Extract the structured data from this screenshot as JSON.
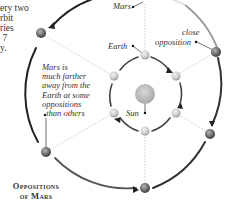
{
  "intro_text": "ery two\nrbit\nries\n 7\ny.",
  "labels": {
    "mars": "Mars",
    "earth": "Earth",
    "close_opposition_1": "close",
    "close_opposition_2": "opposition",
    "sun": "Sun"
  },
  "note": "Mars is\nmuch farther\naway from the\nEarth at some\noppositions\n  than others",
  "title": "Oppositions\nof Mars",
  "colors": {
    "orbit_line": "#2a2a2a",
    "dotted_line": "#bdbdbd",
    "mars_planet": "#6a6a6a",
    "earth_planet": "#cfcfcf",
    "sun": "#bdbdbd"
  }
}
